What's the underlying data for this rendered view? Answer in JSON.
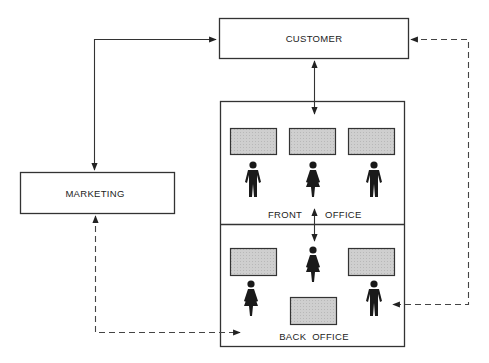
{
  "diagram": {
    "nodes": {
      "customer": {
        "label": "CUSTOMER"
      },
      "marketing": {
        "label": "MARKETING"
      },
      "front_office": {
        "label_left": "FRONT",
        "label_right": "OFFICE"
      },
      "back_office": {
        "label": "BACK  OFFICE"
      }
    },
    "edges": [
      {
        "from": "marketing",
        "to": "customer",
        "style": "solid",
        "direction": "both"
      },
      {
        "from": "customer",
        "to": "front_office",
        "style": "solid",
        "direction": "both"
      },
      {
        "from": "front_office",
        "to": "back_office",
        "style": "solid",
        "direction": "both"
      },
      {
        "from": "back_office",
        "to": "customer",
        "style": "dashed",
        "direction": "both"
      },
      {
        "from": "marketing",
        "to": "back_office",
        "style": "dashed",
        "direction": "both"
      }
    ],
    "colors": {
      "line": "#333333",
      "desk_fill": "#c8c8c8",
      "figure": "#1a1a1a"
    }
  }
}
